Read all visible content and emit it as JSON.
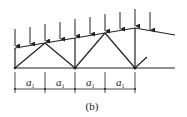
{
  "figure": {
    "caption": "(b)",
    "type": "truss-diagram",
    "stroke_color": "#222222"
  },
  "dimensions": {
    "labels": [
      {
        "symbol": "a",
        "subscript": "1"
      },
      {
        "symbol": "a",
        "subscript": "1"
      },
      {
        "symbol": "a",
        "subscript": "1"
      },
      {
        "symbol": "a",
        "subscript": "1"
      }
    ]
  },
  "loads": {
    "count": 10,
    "icon": "down-arrow-icon"
  }
}
